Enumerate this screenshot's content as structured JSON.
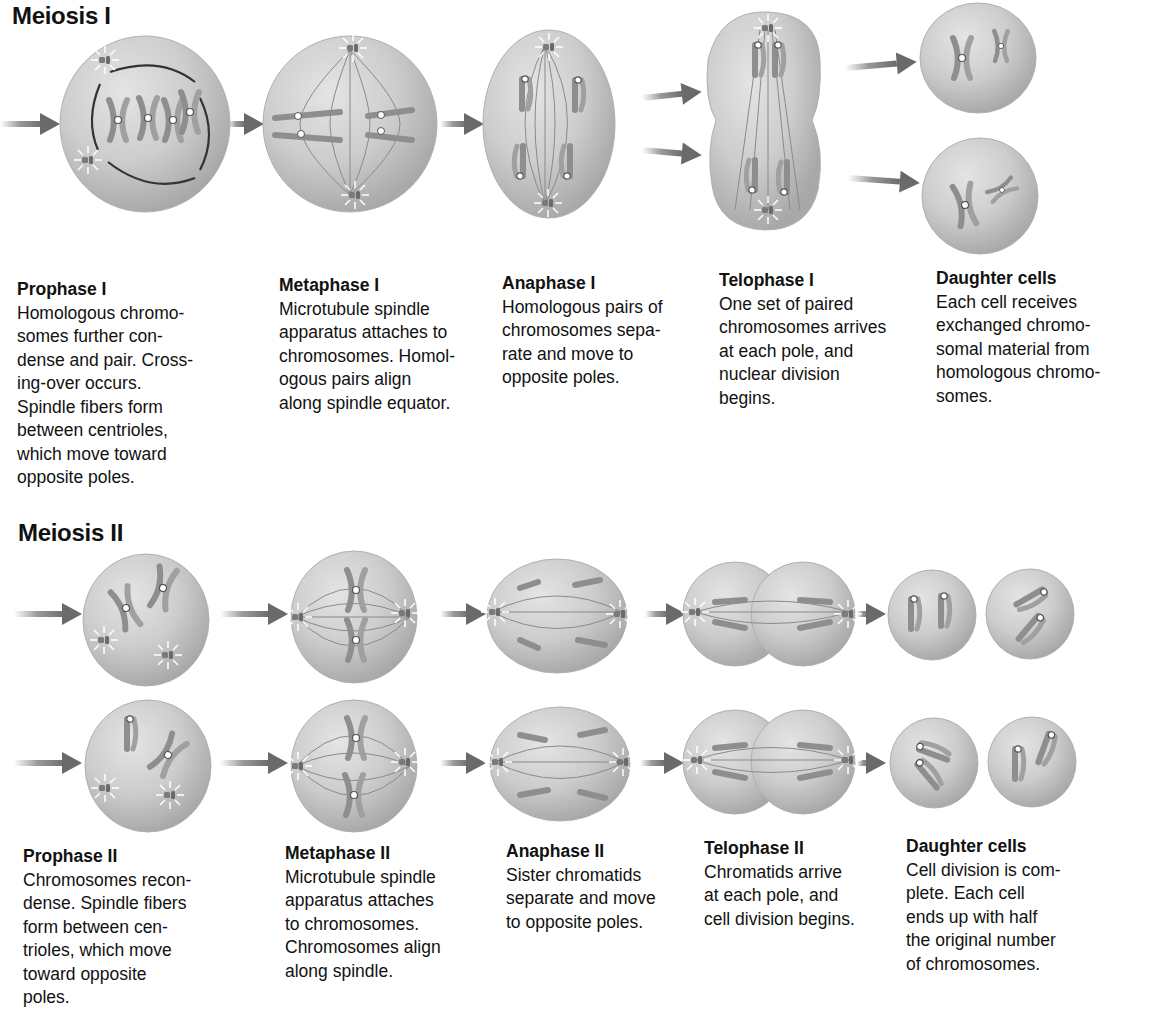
{
  "meiosis1": {
    "title": "Meiosis I",
    "stages": [
      {
        "title": "Prophase I",
        "body": "Homologous chromo-\nsomes further con-\ndense and pair. Cross-\ning-over occurs.\nSpindle fibers form\nbetween centrioles,\nwhich move toward\nopposite poles."
      },
      {
        "title": "Metaphase I",
        "body": "Microtubule spindle\napparatus attaches to\nchromosomes. Homol-\nogous pairs align\nalong spindle equator."
      },
      {
        "title": "Anaphase I",
        "body": "Homologous pairs of\nchromosomes sepa-\nrate and move to\nopposite poles."
      },
      {
        "title": "Telophase I",
        "body": "One set of paired\nchromosomes arrives\nat each pole, and\nnuclear division\nbegins."
      },
      {
        "title": "Daughter cells",
        "body": "Each cell receives\nexchanged chromo-\nsomal material from\nhomologous chromo-\nsomes."
      }
    ]
  },
  "meiosis2": {
    "title": "Meiosis II",
    "stages": [
      {
        "title": "Prophase II",
        "body": "Chromosomes recon-\ndense. Spindle fibers\nform between cen-\ntrioles, which move\ntoward opposite\npoles."
      },
      {
        "title": "Metaphase II",
        "body": "Microtubule spindle\napparatus attaches\nto chromosomes.\nChromosomes align\nalong spindle."
      },
      {
        "title": "Anaphase II",
        "body": "Sister chromatids\nseparate and move\nto opposite poles."
      },
      {
        "title": "Telophase II",
        "body": "Chromatids arrive\nat each pole, and\ncell division begins."
      },
      {
        "title": "Daughter cells",
        "body": "Cell division is com-\nplete. Each cell\nends up with half\nthe original number\nof chromosomes."
      }
    ]
  },
  "colors": {
    "cell_fill": "#c9c9c9",
    "cell_edge": "#9a9a9a",
    "chromosome": "#8e8e8e",
    "arrow": "#6e6e6e",
    "text": "#111111"
  }
}
